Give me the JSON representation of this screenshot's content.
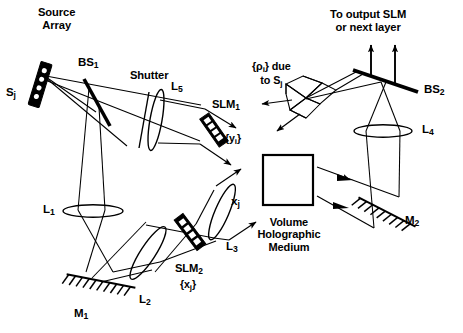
{
  "figure": {
    "type": "optical-ray-diagram",
    "background": "#ffffff",
    "ink": "#000000"
  },
  "labels": {
    "source_array": "Source\nArray",
    "source_element": "S",
    "source_element_sub": "j",
    "bs1": "BS",
    "bs1_sub": "1",
    "shutter": "Shutter",
    "l5": "L",
    "l5_sub": "5",
    "slm1": "SLM",
    "slm1_sub": "1",
    "slm1_set": "{y",
    "slm1_set_sub": "i",
    "slm1_set_end": "}",
    "rho_line1": "{ρ",
    "rho_line1_sub": "i",
    "rho_line1_end": "} due",
    "rho_line2": "to S",
    "rho_line2_sub": "j",
    "to_output_line1": "To output SLM",
    "to_output_line2": "or next layer",
    "bs2": "BS",
    "bs2_sub": "2",
    "l4": "L",
    "l4_sub": "4",
    "l1": "L",
    "l1_sub": "1",
    "l2": "L",
    "l2_sub": "2",
    "l3": "L",
    "l3_sub": "3",
    "m1": "M",
    "m1_sub": "1",
    "m2": "M",
    "m2_sub": "2",
    "slm2": "SLM",
    "slm2_sub": "2",
    "slm2_set": "{x",
    "slm2_set_sub": "j",
    "slm2_set_end": "}",
    "xj": "x",
    "xj_sub": "j",
    "volume_medium": "Volume\nHolographic\nMedium"
  },
  "components": [
    {
      "name": "source-array",
      "kind": "emitter-array",
      "label": "S_j",
      "elements": 4
    },
    {
      "name": "beam-splitter-1",
      "kind": "beam-splitter",
      "label": "BS_1"
    },
    {
      "name": "shutter",
      "kind": "shutter",
      "label": "Shutter"
    },
    {
      "name": "lens-5",
      "kind": "lens",
      "label": "L_5"
    },
    {
      "name": "slm-1",
      "kind": "spatial-light-modulator",
      "label": "SLM_1",
      "data": "{y_i}",
      "pixels": 5
    },
    {
      "name": "lens-1",
      "kind": "lens",
      "label": "L_1"
    },
    {
      "name": "mirror-1",
      "kind": "mirror",
      "label": "M_1"
    },
    {
      "name": "lens-2",
      "kind": "lens",
      "label": "L_2"
    },
    {
      "name": "slm-2",
      "kind": "spatial-light-modulator",
      "label": "SLM_2",
      "data": "{x_j}",
      "pixels": 4
    },
    {
      "name": "lens-3",
      "kind": "lens",
      "label": "L_3"
    },
    {
      "name": "volume-holographic-medium",
      "kind": "hologram",
      "label": "Volume Holographic Medium"
    },
    {
      "name": "mirror-2",
      "kind": "mirror",
      "label": "M_2"
    },
    {
      "name": "lens-4",
      "kind": "lens",
      "label": "L_4"
    },
    {
      "name": "beam-splitter-2",
      "kind": "beam-splitter",
      "label": "BS_2"
    },
    {
      "name": "diffraction-fan",
      "kind": "diffracted-orders",
      "label": "{rho_i} due to S_j"
    }
  ]
}
